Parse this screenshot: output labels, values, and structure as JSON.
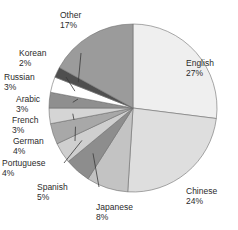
{
  "chart_data": {
    "type": "pie",
    "title": "",
    "subtitle": "",
    "xlabel": "",
    "ylabel": "",
    "legend_position": "none",
    "grid": false,
    "labels_show_percent": true,
    "start_angle_deg": 0,
    "direction": "clockwise",
    "categories": [
      "English",
      "Chinese",
      "Japanese",
      "Spanish",
      "Portuguese",
      "German",
      "French",
      "Arabic",
      "Russian",
      "Korean",
      "Other"
    ],
    "values": [
      27,
      24,
      8,
      5,
      4,
      4,
      3,
      3,
      3,
      2,
      17
    ],
    "units": "%",
    "slices": [
      {
        "label": "English",
        "percent": "27%",
        "value": 27,
        "color": "#efefef",
        "label_x": 186,
        "label_y": 58,
        "align": "left",
        "leader": false
      },
      {
        "label": "Chinese",
        "percent": "24%",
        "value": 24,
        "color": "#dedede",
        "label_x": 186,
        "label_y": 186,
        "align": "left",
        "leader": false
      },
      {
        "label": "Japanese",
        "percent": "8%",
        "value": 8,
        "color": "#c3c3c3",
        "label_x": 96,
        "label_y": 202,
        "align": "left",
        "leader": false
      },
      {
        "label": "Spanish",
        "percent": "5%",
        "value": 5,
        "color": "#8d8d8d",
        "label_x": 37,
        "label_y": 182,
        "align": "left",
        "leader": true
      },
      {
        "label": "Portuguese",
        "percent": "4%",
        "value": 4,
        "color": "#cfcfcf",
        "label_x": 2,
        "label_y": 158,
        "align": "left",
        "leader": true
      },
      {
        "label": "German",
        "percent": "4%",
        "value": 4,
        "color": "#a8a8a8",
        "label_x": 13,
        "label_y": 136,
        "align": "left",
        "leader": true
      },
      {
        "label": "French",
        "percent": "3%",
        "value": 3,
        "color": "#d5d5d5",
        "label_x": 12,
        "label_y": 115,
        "align": "left",
        "leader": true
      },
      {
        "label": "Arabic",
        "percent": "3%",
        "value": 3,
        "color": "#8f8f8f",
        "label_x": 16,
        "label_y": 94,
        "align": "left",
        "leader": true
      },
      {
        "label": "Russian",
        "percent": "3%",
        "value": 3,
        "color": "#ffffff",
        "label_x": 4,
        "label_y": 72,
        "align": "left",
        "leader": true
      },
      {
        "label": "Korean",
        "percent": "2%",
        "value": 2,
        "color": "#4f4f4f",
        "label_x": 19,
        "label_y": 48,
        "align": "left",
        "leader": true
      },
      {
        "label": "Other",
        "percent": "17%",
        "value": 17,
        "color": "#9b9b9b",
        "label_x": 60,
        "label_y": 10,
        "align": "left",
        "leader": false
      }
    ],
    "geometry": {
      "center_x": 133,
      "center_y": 108,
      "radius": 84,
      "stroke_color": "#6f6f6f",
      "leader_color": "#3a3a3a"
    }
  }
}
